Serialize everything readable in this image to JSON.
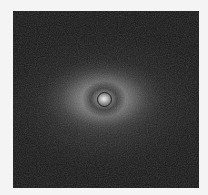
{
  "image": {
    "description": "grayscale astronomical image of a diffuse bright object with circular marker at center",
    "background_color": "#f4f4f4",
    "frame_color": "#141414",
    "core_color": "#f2f2f2",
    "marker": {
      "shape": "circle",
      "cx": 104,
      "cy": 99,
      "r": 7,
      "color": "#1a1a1a"
    }
  }
}
